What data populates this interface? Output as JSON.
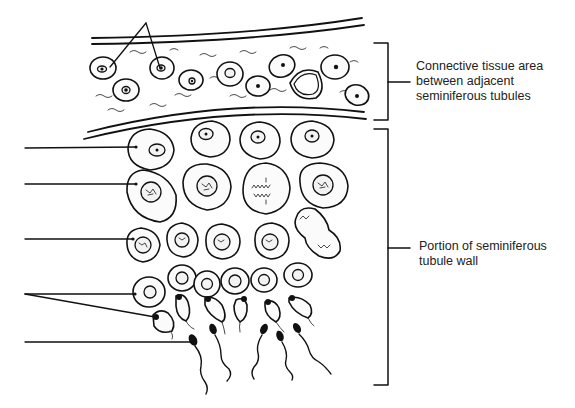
{
  "figure": {
    "labels": {
      "connective_tissue": "Connective tissue area between adjacent seminiferous tubules",
      "tubule_wall": "Portion of seminiferous tubule wall"
    },
    "blank_leader_lines": [
      {
        "id": "top-pair",
        "y": 5,
        "targets": 2
      },
      {
        "id": "left-1",
        "y": 148
      },
      {
        "id": "left-2",
        "y": 184
      },
      {
        "id": "left-3",
        "y": 239
      },
      {
        "id": "left-4-pair",
        "y": 294,
        "targets": 2
      },
      {
        "id": "left-5",
        "y": 342
      }
    ],
    "brackets": [
      {
        "id": "connective-tissue-bracket",
        "top": 43,
        "bottom": 120
      },
      {
        "id": "tubule-wall-bracket",
        "top": 129,
        "bottom": 385
      }
    ]
  }
}
